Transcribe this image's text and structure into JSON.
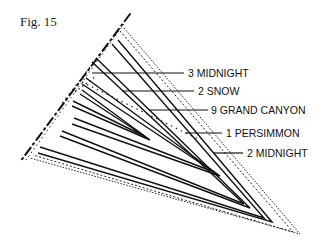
{
  "figure": {
    "title": "Fig. 15"
  },
  "labels": [
    {
      "id": "l1",
      "text": "3 MIDNIGHT"
    },
    {
      "id": "l2",
      "text": "2 SNOW"
    },
    {
      "id": "l3",
      "text": "9 GRAND CANYON"
    },
    {
      "id": "l4",
      "text": "1 PERSIMMON"
    },
    {
      "id": "l5",
      "text": "2 MIDNIGHT"
    }
  ],
  "colors": {
    "line": "#111111",
    "background": "#ffffff"
  }
}
